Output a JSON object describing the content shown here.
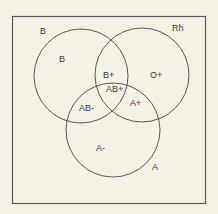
{
  "diagram": {
    "type": "venn",
    "background": "#f4f1e6",
    "stroke": "#555555",
    "frame": {
      "x": 12,
      "y": 16,
      "w": 194,
      "h": 188
    },
    "sets": [
      {
        "name": "B",
        "label": "B",
        "cx": 81,
        "cy": 76,
        "r": 47
      },
      {
        "name": "Rh",
        "label": "Rh",
        "cx": 142,
        "cy": 75,
        "r": 47
      },
      {
        "name": "A",
        "label": "A",
        "cx": 113,
        "cy": 130,
        "r": 47
      }
    ],
    "set_labels": {
      "b": "B",
      "rh": "Rh",
      "a": "A"
    },
    "regions": {
      "b_only": "B",
      "b_pos": "B+",
      "o_pos": "O+",
      "ab_pos": "AB+",
      "ab_neg": "AB-",
      "a_pos": "A+",
      "a_neg": "A-"
    }
  }
}
